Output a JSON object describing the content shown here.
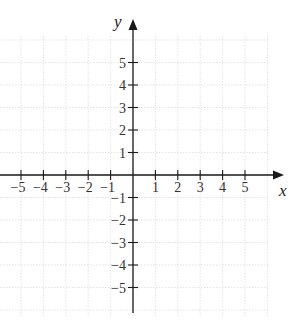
{
  "chart_data": {
    "type": "coordinate-plane",
    "title": "",
    "xlabel": "x",
    "ylabel": "y",
    "xlim": [
      -6,
      6
    ],
    "ylim": [
      -6,
      6
    ],
    "grid": true,
    "x_ticks": [
      -5,
      -4,
      -3,
      -2,
      -1,
      1,
      2,
      3,
      4,
      5
    ],
    "y_ticks": [
      5,
      4,
      3,
      2,
      1,
      -1,
      -2,
      -3,
      -4,
      -5
    ],
    "x_tick_labels": [
      "−5",
      "−4",
      "−3",
      "−2",
      "−1",
      "1",
      "2",
      "3",
      "4",
      "5"
    ],
    "y_tick_labels": [
      "5",
      "4",
      "3",
      "2",
      "1",
      "−1",
      "−2",
      "−3",
      "−4",
      "−5"
    ],
    "series": []
  },
  "colors": {
    "axis": "#1a1a1a",
    "grid": "#d0d0d0",
    "text": "#333333"
  }
}
